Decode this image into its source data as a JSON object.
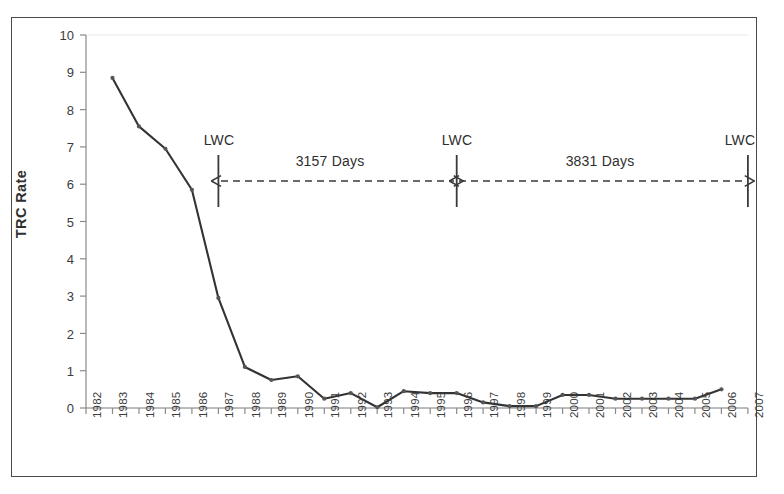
{
  "chart_data": {
    "type": "line",
    "title": "",
    "xlabel": "",
    "ylabel": "TRC Rate",
    "xlim": [
      1982,
      2007
    ],
    "ylim": [
      0,
      10
    ],
    "grid": false,
    "legend": null,
    "x": [
      1983,
      1984,
      1985,
      1986,
      1987,
      1988,
      1989,
      1990,
      1991,
      1992,
      1993,
      1994,
      1995,
      1996,
      1997,
      1998,
      1999,
      2000,
      2001,
      2002,
      2003,
      2004,
      2005,
      2006
    ],
    "values": [
      8.85,
      7.55,
      6.95,
      5.85,
      2.95,
      1.1,
      0.75,
      0.85,
      0.25,
      0.4,
      0.02,
      0.45,
      0.4,
      0.4,
      0.15,
      0.05,
      0.05,
      0.35,
      0.35,
      0.25,
      0.25,
      0.25,
      0.25,
      0.5
    ],
    "series": [
      {
        "name": "TRC Rate",
        "values": [
          8.85,
          7.55,
          6.95,
          5.85,
          2.95,
          1.1,
          0.75,
          0.85,
          0.25,
          0.4,
          0.02,
          0.45,
          0.4,
          0.4,
          0.15,
          0.05,
          0.05,
          0.35,
          0.35,
          0.25,
          0.25,
          0.25,
          0.25,
          0.5
        ]
      }
    ],
    "y_ticks": [
      "0",
      "1",
      "2",
      "3",
      "4",
      "5",
      "6",
      "7",
      "8",
      "9",
      "10"
    ],
    "x_ticks": [
      "1982",
      "1983",
      "1984",
      "1985",
      "1986",
      "1987",
      "1988",
      "1989",
      "1990",
      "1991",
      "1992",
      "1993",
      "1994",
      "1995",
      "1996",
      "1997",
      "1998",
      "1999",
      "2000",
      "2001",
      "2002",
      "2003",
      "2004",
      "2005",
      "2006",
      "2007"
    ],
    "series_color": "#333333",
    "marker_color": "#555555",
    "annotations": [
      {
        "name": "lwc-marker-left",
        "label": "LWC",
        "x": 1987
      },
      {
        "name": "lwc-marker-middle",
        "label": "LWC",
        "x": 1996
      },
      {
        "name": "lwc-marker-right",
        "label": "LWC",
        "x": 2007
      },
      {
        "name": "interval-left",
        "label": "3157 Days",
        "from": 1987,
        "to": 1996
      },
      {
        "name": "interval-right",
        "label": "3831 Days",
        "from": 1996,
        "to": 2007
      }
    ]
  },
  "axes": {
    "y_title": "TRC Rate"
  },
  "annotations": {
    "lwc_left": "LWC",
    "lwc_middle": "LWC",
    "lwc_right": "LWC",
    "days_left": "3157 Days",
    "days_right": "3831 Days"
  }
}
